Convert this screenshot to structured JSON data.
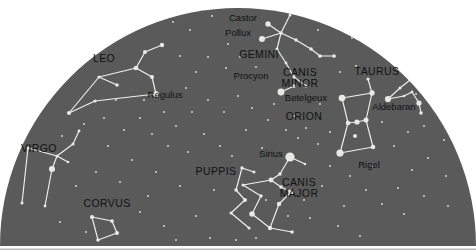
{
  "figure": {
    "type": "star-chart",
    "projection": "horizon dome (semi-ellipse)",
    "width": 476,
    "height": 251
  },
  "colors": {
    "sky": "#5a5a5a",
    "sky_edge": "#4e4e4e",
    "page_background": "#ffffff",
    "bottom_border": "#b8b8b8",
    "star": "#e8e8e6",
    "star_dim": "#cfcfcc",
    "constellation_line": "#f0f0ee",
    "label_text": "#111111"
  },
  "dome": {
    "center_x": 238,
    "base_y": 246,
    "radius_x": 238,
    "radius_y": 238,
    "top_y": 8
  },
  "constellation_labels": [
    {
      "name": "LEO",
      "x": 104,
      "y": 62
    },
    {
      "name": "GEMINI",
      "x": 259,
      "y": 58
    },
    {
      "name": "CANIS MINOR",
      "x": 300,
      "y": 76,
      "lines": [
        "CANIS",
        "MINOR"
      ]
    },
    {
      "name": "TAURUS",
      "x": 377,
      "y": 75
    },
    {
      "name": "ORION",
      "x": 304,
      "y": 120
    },
    {
      "name": "VIRGO",
      "x": 39,
      "y": 152
    },
    {
      "name": "PUPPIS",
      "x": 216,
      "y": 175
    },
    {
      "name": "CANIS MAJOR",
      "x": 299,
      "y": 186,
      "lines": [
        "CANIS",
        "MAJOR"
      ]
    },
    {
      "name": "CORVUS",
      "x": 107,
      "y": 207
    }
  ],
  "star_labels": [
    {
      "name": "Castor",
      "x": 243,
      "y": 21
    },
    {
      "name": "Pollux",
      "x": 238,
      "y": 36
    },
    {
      "name": "Procyon",
      "x": 251,
      "y": 79
    },
    {
      "name": "Betelgeux",
      "x": 306,
      "y": 101
    },
    {
      "name": "Aldebaran",
      "x": 394,
      "y": 110
    },
    {
      "name": "Regulus",
      "x": 165,
      "y": 98
    },
    {
      "name": "Sirius",
      "x": 271,
      "y": 157
    },
    {
      "name": "Rigel",
      "x": 369,
      "y": 168
    }
  ],
  "constellations": [
    {
      "name": "LEO",
      "stars": [
        {
          "id": "L1",
          "x": 162,
          "y": 45,
          "mag": 2.4
        },
        {
          "id": "L2",
          "x": 145,
          "y": 52,
          "mag": 2.6
        },
        {
          "id": "L3",
          "x": 136,
          "y": 68,
          "mag": 2.1
        },
        {
          "id": "L4",
          "x": 152,
          "y": 77,
          "mag": 2.6
        },
        {
          "id": "L5_Regulus",
          "x": 156,
          "y": 94,
          "mag": 1.4,
          "label": "Regulus"
        },
        {
          "id": "L6",
          "x": 117,
          "y": 85,
          "mag": 3.0
        },
        {
          "id": "L7",
          "x": 99,
          "y": 77,
          "mag": 3.3
        },
        {
          "id": "L8",
          "x": 95,
          "y": 101,
          "mag": 3.3
        },
        {
          "id": "L9",
          "x": 69,
          "y": 113,
          "mag": 2.6
        }
      ],
      "lines": [
        [
          "L1",
          "L2"
        ],
        [
          "L2",
          "L3"
        ],
        [
          "L3",
          "L4"
        ],
        [
          "L4",
          "L5_Regulus"
        ],
        [
          "L3",
          "L7"
        ],
        [
          "L7",
          "L6"
        ],
        [
          "L7",
          "L9"
        ],
        [
          "L9",
          "L8"
        ],
        [
          "L8",
          "L5_Regulus"
        ]
      ]
    },
    {
      "name": "GEMINI",
      "stars": [
        {
          "id": "G_Castor",
          "x": 268,
          "y": 24,
          "mag": 1.6,
          "label": "Castor"
        },
        {
          "id": "G_Pollux",
          "x": 262,
          "y": 39,
          "mag": 1.1,
          "label": "Pollux"
        },
        {
          "id": "G1",
          "x": 290,
          "y": 15,
          "mag": 3.5
        },
        {
          "id": "G2",
          "x": 281,
          "y": 33,
          "mag": 3.0
        },
        {
          "id": "G3",
          "x": 277,
          "y": 49,
          "mag": 3.5
        },
        {
          "id": "G4",
          "x": 296,
          "y": 40,
          "mag": 3.2
        },
        {
          "id": "G5",
          "x": 311,
          "y": 49,
          "mag": 3.0
        },
        {
          "id": "G6",
          "x": 320,
          "y": 56,
          "mag": 2.9
        },
        {
          "id": "G7",
          "x": 334,
          "y": 56,
          "mag": 2.9
        },
        {
          "id": "G8",
          "x": 286,
          "y": 63,
          "mag": 3.6
        },
        {
          "id": "G9",
          "x": 294,
          "y": 77,
          "mag": 3.6
        },
        {
          "id": "G10",
          "x": 306,
          "y": 86,
          "mag": 3.3
        }
      ],
      "lines": [
        [
          "G_Castor",
          "G2"
        ],
        [
          "G_Pollux",
          "G2"
        ],
        [
          "G2",
          "G1"
        ],
        [
          "G2",
          "G4"
        ],
        [
          "G4",
          "G5"
        ],
        [
          "G5",
          "G6"
        ],
        [
          "G6",
          "G7"
        ],
        [
          "G2",
          "G3"
        ],
        [
          "G3",
          "G8"
        ],
        [
          "G8",
          "G9"
        ],
        [
          "G9",
          "G10"
        ]
      ]
    },
    {
      "name": "CANIS MINOR",
      "stars": [
        {
          "id": "CMi_Procyon",
          "x": 281,
          "y": 92,
          "mag": 0.4,
          "label": "Procyon"
        },
        {
          "id": "CMi2",
          "x": 294,
          "y": 86,
          "mag": 2.9
        }
      ],
      "lines": [
        [
          "CMi_Procyon",
          "CMi2"
        ]
      ]
    },
    {
      "name": "ORION",
      "stars": [
        {
          "id": "O_Betelgeux",
          "x": 342,
          "y": 98,
          "mag": 0.5,
          "label": "Betelgeux"
        },
        {
          "id": "O_Bellatrix",
          "x": 372,
          "y": 93,
          "mag": 1.6
        },
        {
          "id": "O_Mintaka",
          "x": 348,
          "y": 123,
          "mag": 2.2
        },
        {
          "id": "O_Alnilam",
          "x": 357,
          "y": 122,
          "mag": 1.7
        },
        {
          "id": "O_Alnitak",
          "x": 366,
          "y": 120,
          "mag": 1.8
        },
        {
          "id": "O_Saiph",
          "x": 373,
          "y": 147,
          "mag": 2.1
        },
        {
          "id": "O_Rigel",
          "x": 340,
          "y": 153,
          "mag": 0.1,
          "label": "Rigel"
        },
        {
          "id": "O_head",
          "x": 368,
          "y": 79,
          "mag": 3.4
        },
        {
          "id": "O_sword",
          "x": 355,
          "y": 136,
          "mag": 2.8
        }
      ],
      "lines": [
        [
          "O_Betelgeux",
          "O_Bellatrix"
        ],
        [
          "O_Bellatrix",
          "O_head"
        ],
        [
          "O_Betelgeux",
          "O_Mintaka"
        ],
        [
          "O_Mintaka",
          "O_Alnilam"
        ],
        [
          "O_Alnilam",
          "O_Alnitak"
        ],
        [
          "O_Bellatrix",
          "O_Alnitak"
        ],
        [
          "O_Mintaka",
          "O_Rigel"
        ],
        [
          "O_Alnitak",
          "O_Saiph"
        ],
        [
          "O_Rigel",
          "O_Saiph"
        ]
      ]
    },
    {
      "name": "TAURUS",
      "stars": [
        {
          "id": "T_Aldebaran",
          "x": 388,
          "y": 99,
          "mag": 0.9,
          "label": "Aldebaran"
        },
        {
          "id": "T1",
          "x": 400,
          "y": 88,
          "mag": 3.5
        },
        {
          "id": "T2",
          "x": 410,
          "y": 80,
          "mag": 3.4
        },
        {
          "id": "T3",
          "x": 404,
          "y": 96,
          "mag": 3.8
        },
        {
          "id": "T4",
          "x": 412,
          "y": 92,
          "mag": 3.6
        },
        {
          "id": "T5",
          "x": 419,
          "y": 103,
          "mag": 1.7
        },
        {
          "id": "T6",
          "x": 374,
          "y": 47,
          "mag": 3.0
        },
        {
          "id": "T7",
          "x": 421,
          "y": 113,
          "mag": 3.0
        },
        {
          "id": "T_Pleiades",
          "x": 416,
          "y": 94,
          "mag": 4.2
        }
      ],
      "lines": [
        [
          "T6",
          "T2"
        ],
        [
          "T2",
          "T1"
        ],
        [
          "T1",
          "T_Aldebaran"
        ],
        [
          "T_Aldebaran",
          "T3"
        ],
        [
          "T3",
          "T4"
        ],
        [
          "T4",
          "T5"
        ],
        [
          "T5",
          "T7"
        ]
      ]
    },
    {
      "name": "CANIS MAJOR",
      "stars": [
        {
          "id": "CMa_Sirius",
          "x": 290,
          "y": 157,
          "mag": -1.5,
          "label": "Sirius"
        },
        {
          "id": "CMa1",
          "x": 305,
          "y": 164,
          "mag": 3.9
        },
        {
          "id": "CMa2",
          "x": 280,
          "y": 174,
          "mag": 3.0
        },
        {
          "id": "CMa3",
          "x": 271,
          "y": 180,
          "mag": 2.0
        },
        {
          "id": "CMa4",
          "x": 281,
          "y": 187,
          "mag": 3.0
        },
        {
          "id": "CMa5",
          "x": 291,
          "y": 192,
          "mag": 1.8
        },
        {
          "id": "CMa6",
          "x": 279,
          "y": 204,
          "mag": 2.4
        },
        {
          "id": "CMa7",
          "x": 261,
          "y": 196,
          "mag": 3.0
        },
        {
          "id": "CMa8",
          "x": 252,
          "y": 214,
          "mag": 1.5
        },
        {
          "id": "CMa9",
          "x": 270,
          "y": 228,
          "mag": 2.4
        },
        {
          "id": "CMa10",
          "x": 292,
          "y": 232,
          "mag": 3.0
        },
        {
          "id": "CMa11",
          "x": 243,
          "y": 185,
          "mag": 3.5
        }
      ],
      "lines": [
        [
          "CMa_Sirius",
          "CMa1"
        ],
        [
          "CMa_Sirius",
          "CMa2"
        ],
        [
          "CMa2",
          "CMa3"
        ],
        [
          "CMa3",
          "CMa4"
        ],
        [
          "CMa4",
          "CMa5"
        ],
        [
          "CMa5",
          "CMa6"
        ],
        [
          "CMa6",
          "CMa9"
        ],
        [
          "CMa9",
          "CMa10"
        ],
        [
          "CMa3",
          "CMa11"
        ],
        [
          "CMa11",
          "CMa7"
        ],
        [
          "CMa7",
          "CMa8"
        ],
        [
          "CMa8",
          "CMa9"
        ]
      ]
    },
    {
      "name": "PUPPIS",
      "stars": [
        {
          "id": "P1",
          "x": 242,
          "y": 168,
          "mag": 3.2
        },
        {
          "id": "P2",
          "x": 254,
          "y": 172,
          "mag": 3.5
        },
        {
          "id": "P3",
          "x": 236,
          "y": 190,
          "mag": 3.0
        },
        {
          "id": "P4",
          "x": 245,
          "y": 200,
          "mag": 2.8
        },
        {
          "id": "P5",
          "x": 231,
          "y": 213,
          "mag": 3.3
        },
        {
          "id": "P6",
          "x": 249,
          "y": 228,
          "mag": 3.4
        }
      ],
      "lines": [
        [
          "P1",
          "P2"
        ],
        [
          "P1",
          "P3"
        ],
        [
          "P3",
          "P4"
        ],
        [
          "P4",
          "P5"
        ],
        [
          "P5",
          "P6"
        ]
      ]
    },
    {
      "name": "VIRGO",
      "stars": [
        {
          "id": "V1",
          "x": 79,
          "y": 131,
          "mag": 3.6
        },
        {
          "id": "V2",
          "x": 73,
          "y": 144,
          "mag": 3.4
        },
        {
          "id": "V3",
          "x": 57,
          "y": 156,
          "mag": 3.4
        },
        {
          "id": "V4",
          "x": 28,
          "y": 148,
          "mag": 3.6
        },
        {
          "id": "V_Spica",
          "x": 52,
          "y": 169,
          "mag": 1.0
        },
        {
          "id": "V5",
          "x": 22,
          "y": 203,
          "mag": 3.4
        },
        {
          "id": "V6",
          "x": 45,
          "y": 206,
          "mag": 3.6
        },
        {
          "id": "V7",
          "x": 68,
          "y": 162,
          "mag": 3.8
        }
      ],
      "lines": [
        [
          "V1",
          "V2"
        ],
        [
          "V2",
          "V3"
        ],
        [
          "V3",
          "V4"
        ],
        [
          "V3",
          "V_Spica"
        ],
        [
          "V4",
          "V5"
        ],
        [
          "V_Spica",
          "V6"
        ],
        [
          "V3",
          "V7"
        ]
      ]
    },
    {
      "name": "CORVUS",
      "stars": [
        {
          "id": "C1",
          "x": 92,
          "y": 217,
          "mag": 2.6
        },
        {
          "id": "C2",
          "x": 112,
          "y": 221,
          "mag": 2.9
        },
        {
          "id": "C3",
          "x": 117,
          "y": 233,
          "mag": 2.6
        },
        {
          "id": "C4",
          "x": 98,
          "y": 240,
          "mag": 3.0
        }
      ],
      "lines": [
        [
          "C1",
          "C2"
        ],
        [
          "C2",
          "C3"
        ],
        [
          "C3",
          "C4"
        ],
        [
          "C4",
          "C1"
        ]
      ]
    }
  ],
  "field_stars": [
    {
      "x": 212,
      "y": 16,
      "mag": 4.5
    },
    {
      "x": 190,
      "y": 30,
      "mag": 4.6
    },
    {
      "x": 173,
      "y": 22,
      "mag": 4.8
    },
    {
      "x": 228,
      "y": 44,
      "mag": 4.4
    },
    {
      "x": 208,
      "y": 57,
      "mag": 4.6
    },
    {
      "x": 196,
      "y": 72,
      "mag": 4.7
    },
    {
      "x": 180,
      "y": 56,
      "mag": 4.8
    },
    {
      "x": 226,
      "y": 68,
      "mag": 4.5
    },
    {
      "x": 240,
      "y": 57,
      "mag": 4.8
    },
    {
      "x": 256,
      "y": 67,
      "mag": 4.6
    },
    {
      "x": 318,
      "y": 30,
      "mag": 4.6
    },
    {
      "x": 338,
      "y": 22,
      "mag": 4.8
    },
    {
      "x": 352,
      "y": 38,
      "mag": 4.5
    },
    {
      "x": 356,
      "y": 66,
      "mag": 4.6
    },
    {
      "x": 340,
      "y": 72,
      "mag": 4.7
    },
    {
      "x": 392,
      "y": 58,
      "mag": 4.5
    },
    {
      "x": 404,
      "y": 66,
      "mag": 4.8
    },
    {
      "x": 432,
      "y": 96,
      "mag": 4.6
    },
    {
      "x": 440,
      "y": 112,
      "mag": 4.5
    },
    {
      "x": 424,
      "y": 126,
      "mag": 4.7
    },
    {
      "x": 408,
      "y": 132,
      "mag": 4.6
    },
    {
      "x": 444,
      "y": 140,
      "mag": 4.5
    },
    {
      "x": 428,
      "y": 158,
      "mag": 4.7
    },
    {
      "x": 412,
      "y": 170,
      "mag": 4.6
    },
    {
      "x": 446,
      "y": 176,
      "mag": 4.5
    },
    {
      "x": 398,
      "y": 188,
      "mag": 4.6
    },
    {
      "x": 424,
      "y": 196,
      "mag": 4.7
    },
    {
      "x": 448,
      "y": 206,
      "mag": 4.5
    },
    {
      "x": 404,
      "y": 214,
      "mag": 4.6
    },
    {
      "x": 382,
      "y": 204,
      "mag": 4.7
    },
    {
      "x": 366,
      "y": 190,
      "mag": 4.6
    },
    {
      "x": 350,
      "y": 176,
      "mag": 4.8
    },
    {
      "x": 330,
      "y": 166,
      "mag": 4.6
    },
    {
      "x": 318,
      "y": 144,
      "mag": 4.7
    },
    {
      "x": 330,
      "y": 132,
      "mag": 4.8
    },
    {
      "x": 306,
      "y": 128,
      "mag": 4.6
    },
    {
      "x": 294,
      "y": 116,
      "mag": 4.7
    },
    {
      "x": 286,
      "y": 130,
      "mag": 4.5
    },
    {
      "x": 298,
      "y": 138,
      "mag": 4.6
    },
    {
      "x": 268,
      "y": 120,
      "mag": 4.8
    },
    {
      "x": 252,
      "y": 108,
      "mag": 4.6
    },
    {
      "x": 238,
      "y": 96,
      "mag": 4.7
    },
    {
      "x": 224,
      "y": 112,
      "mag": 4.5
    },
    {
      "x": 208,
      "y": 100,
      "mag": 4.8
    },
    {
      "x": 192,
      "y": 112,
      "mag": 4.6
    },
    {
      "x": 176,
      "y": 126,
      "mag": 4.7
    },
    {
      "x": 204,
      "y": 134,
      "mag": 4.5
    },
    {
      "x": 220,
      "y": 146,
      "mag": 4.6
    },
    {
      "x": 188,
      "y": 152,
      "mag": 4.7
    },
    {
      "x": 168,
      "y": 146,
      "mag": 4.8
    },
    {
      "x": 152,
      "y": 134,
      "mag": 4.6
    },
    {
      "x": 140,
      "y": 118,
      "mag": 4.7
    },
    {
      "x": 124,
      "y": 130,
      "mag": 4.5
    },
    {
      "x": 108,
      "y": 146,
      "mag": 4.6
    },
    {
      "x": 132,
      "y": 160,
      "mag": 4.7
    },
    {
      "x": 156,
      "y": 172,
      "mag": 4.5
    },
    {
      "x": 180,
      "y": 186,
      "mag": 4.6
    },
    {
      "x": 148,
      "y": 196,
      "mag": 4.7
    },
    {
      "x": 120,
      "y": 182,
      "mag": 4.8
    },
    {
      "x": 96,
      "y": 172,
      "mag": 4.6
    },
    {
      "x": 76,
      "y": 186,
      "mag": 4.7
    },
    {
      "x": 60,
      "y": 222,
      "mag": 4.5
    },
    {
      "x": 86,
      "y": 232,
      "mag": 4.6
    },
    {
      "x": 140,
      "y": 212,
      "mag": 4.7
    },
    {
      "x": 164,
      "y": 226,
      "mag": 4.5
    },
    {
      "x": 196,
      "y": 216,
      "mag": 4.6
    },
    {
      "x": 210,
      "y": 238,
      "mag": 4.7
    },
    {
      "x": 176,
      "y": 240,
      "mag": 4.5
    },
    {
      "x": 236,
      "y": 240,
      "mag": 4.6
    },
    {
      "x": 256,
      "y": 238,
      "mag": 4.8
    },
    {
      "x": 310,
      "y": 218,
      "mag": 4.6
    },
    {
      "x": 338,
      "y": 226,
      "mag": 4.7
    },
    {
      "x": 360,
      "y": 236,
      "mag": 4.5
    },
    {
      "x": 274,
      "y": 104,
      "mag": 4.8
    },
    {
      "x": 262,
      "y": 148,
      "mag": 4.6
    },
    {
      "x": 246,
      "y": 130,
      "mag": 4.7
    },
    {
      "x": 320,
      "y": 104,
      "mag": 4.5
    },
    {
      "x": 382,
      "y": 122,
      "mag": 4.7
    },
    {
      "x": 394,
      "y": 146,
      "mag": 4.6
    },
    {
      "x": 372,
      "y": 166,
      "mag": 4.8
    },
    {
      "x": 116,
      "y": 100,
      "mag": 4.6
    },
    {
      "x": 84,
      "y": 124,
      "mag": 4.7
    },
    {
      "x": 62,
      "y": 136,
      "mag": 4.8
    },
    {
      "x": 104,
      "y": 118,
      "mag": 4.5
    },
    {
      "x": 144,
      "y": 100,
      "mag": 4.7
    },
    {
      "x": 186,
      "y": 88,
      "mag": 4.6
    },
    {
      "x": 164,
      "y": 112,
      "mag": 4.8
    },
    {
      "x": 266,
      "y": 200,
      "mag": 4.6
    },
    {
      "x": 304,
      "y": 200,
      "mag": 4.7
    },
    {
      "x": 322,
      "y": 186,
      "mag": 4.5
    },
    {
      "x": 344,
      "y": 206,
      "mag": 4.8
    },
    {
      "x": 288,
      "y": 216,
      "mag": 4.6
    },
    {
      "x": 232,
      "y": 156,
      "mag": 4.7
    },
    {
      "x": 214,
      "y": 190,
      "mag": 4.8
    }
  ]
}
